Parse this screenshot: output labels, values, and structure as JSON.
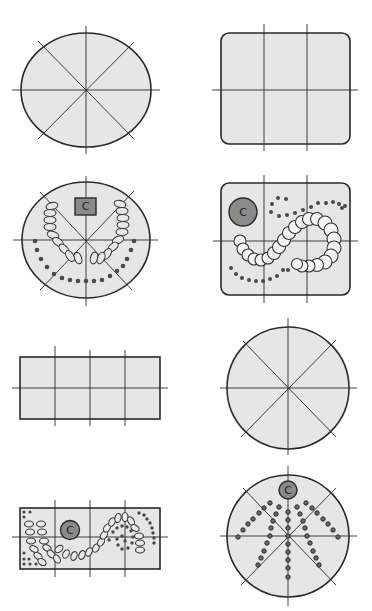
{
  "diagram": {
    "title": "",
    "colors": {
      "room_fill": "#e6e6e6",
      "outline": "#2a2a2a",
      "teacher_fill": "#8a8a8a",
      "seat_fill": "#e8e8e8"
    },
    "panels": [
      {
        "id": 1,
        "shape": "oval",
        "content": "empty with 4 crossing axes (8 sectors)"
      },
      {
        "id": 2,
        "shape": "rounded-rectangle",
        "content": "empty with 2 vertical and 1 horizontal axis"
      },
      {
        "id": 3,
        "shape": "oval",
        "content": "seating: two ellipse-seat arcs + dot arc, teacher desk",
        "teacher_label": "C"
      },
      {
        "id": 4,
        "shape": "rounded-rectangle",
        "content": "seating: S-curve of large circle seats + dot rows, teacher circle",
        "teacher_label": "C"
      },
      {
        "id": 5,
        "shape": "rectangle",
        "content": "empty with 3 vertical and 1 horizontal axis"
      },
      {
        "id": 6,
        "shape": "circle",
        "content": "empty with 4 crossing axes (8 sectors)"
      },
      {
        "id": 7,
        "shape": "rectangle",
        "content": "seating: ellipse seats in wave + spiral dots, teacher circle",
        "teacher_label": "C"
      },
      {
        "id": 8,
        "shape": "circle",
        "content": "seating: radiating rows of dot seats, teacher circle at top",
        "teacher_label": "C"
      }
    ]
  }
}
